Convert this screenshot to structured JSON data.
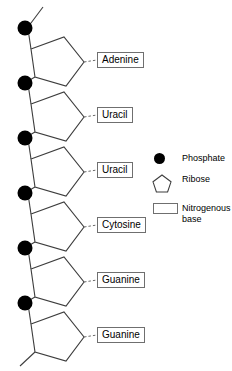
{
  "diagram": {
    "colors": {
      "phosphate": "#000000",
      "stroke": "#3d3d3d",
      "box_border": "#6f6f6f",
      "background": "#ffffff"
    },
    "nucleotides": [
      {
        "base": "Adenine",
        "phosphate_label": "phosphate",
        "ribose_label": "ribose"
      },
      {
        "base": "Uracil",
        "phosphate_label": "phosphate",
        "ribose_label": "ribose"
      },
      {
        "base": "Uracil",
        "phosphate_label": "phosphate",
        "ribose_label": "ribose"
      },
      {
        "base": "Cytosine",
        "phosphate_label": "phosphate",
        "ribose_label": "ribose"
      },
      {
        "base": "Guanine",
        "phosphate_label": "phosphate",
        "ribose_label": "ribose"
      },
      {
        "base": "Guanine",
        "phosphate_label": "phosphate",
        "ribose_label": "ribose"
      }
    ]
  },
  "legend": {
    "items": [
      {
        "glyph": "filled-circle-icon",
        "label": "Phosphate"
      },
      {
        "glyph": "pentagon-icon",
        "label": "Ribose"
      },
      {
        "glyph": "rectangle-icon",
        "label": "Nitrogenous base"
      }
    ]
  }
}
